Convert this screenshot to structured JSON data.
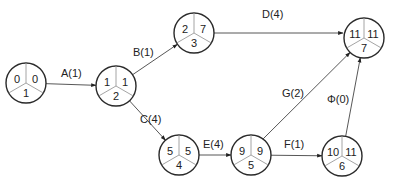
{
  "diagram": {
    "type": "activity-on-arrow network",
    "nodes": [
      {
        "id": "1",
        "earliest": "0",
        "latest": "0",
        "number": "1"
      },
      {
        "id": "2",
        "earliest": "1",
        "latest": "1",
        "number": "2"
      },
      {
        "id": "3",
        "earliest": "2",
        "latest": "7",
        "number": "3"
      },
      {
        "id": "4",
        "earliest": "5",
        "latest": "5",
        "number": "4"
      },
      {
        "id": "5",
        "earliest": "9",
        "latest": "9",
        "number": "5"
      },
      {
        "id": "6",
        "earliest": "10",
        "latest": "11",
        "number": "6"
      },
      {
        "id": "7",
        "earliest": "11",
        "latest": "11",
        "number": "7"
      }
    ],
    "edges": [
      {
        "from": "1",
        "to": "2",
        "label": "A(1)"
      },
      {
        "from": "2",
        "to": "3",
        "label": "B(1)"
      },
      {
        "from": "2",
        "to": "4",
        "label": "C(4)"
      },
      {
        "from": "3",
        "to": "7",
        "label": "D(4)"
      },
      {
        "from": "4",
        "to": "5",
        "label": "E(4)"
      },
      {
        "from": "5",
        "to": "6",
        "label": "F(1)"
      },
      {
        "from": "5",
        "to": "7",
        "label": "G(2)"
      },
      {
        "from": "6",
        "to": "7",
        "label": "Φ(0)"
      }
    ]
  }
}
